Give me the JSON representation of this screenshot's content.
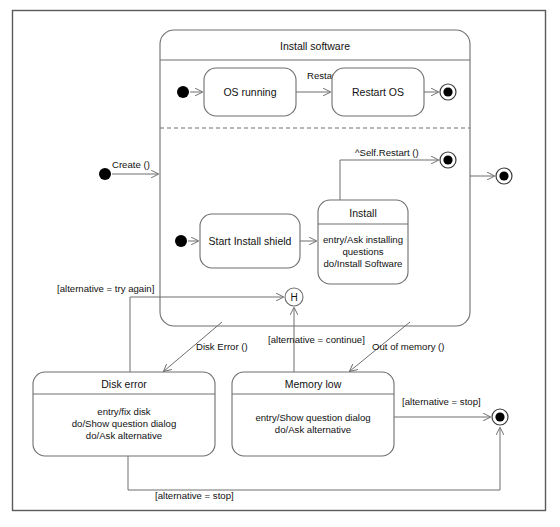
{
  "diagram": {
    "kind": "uml-state-machine-diagram",
    "composite": {
      "title": "Install software",
      "bounds": {
        "x": 160,
        "y": 30,
        "w": 310,
        "h": 296,
        "r": 14
      },
      "title_divider_y": 60,
      "region_divider_y": 128
    },
    "states": [
      {
        "id": "os-running",
        "name": "OS running",
        "x": 204,
        "y": 68,
        "w": 92,
        "h": 48,
        "r": 12,
        "body": []
      },
      {
        "id": "restart-os",
        "name": "Restart OS",
        "x": 332,
        "y": 68,
        "w": 92,
        "h": 48,
        "r": 12,
        "body": []
      },
      {
        "id": "start-install-shield",
        "name": "Start Install shield",
        "x": 200,
        "y": 214,
        "w": 100,
        "h": 54,
        "r": 12,
        "body": []
      },
      {
        "id": "install",
        "name": "Install",
        "x": 318,
        "y": 200,
        "w": 90,
        "h": 84,
        "r": 12,
        "title_divider_y": 224,
        "body": [
          "entry/Ask installing",
          "questions",
          "do/Install Software"
        ]
      },
      {
        "id": "disk-error",
        "name": "Disk error",
        "x": 33,
        "y": 372,
        "w": 182,
        "h": 84,
        "r": 12,
        "title_divider_y": 394,
        "body": [
          "entry/fix disk",
          "do/Show question dialog",
          "do/Ask alternative"
        ]
      },
      {
        "id": "memory-low",
        "name": "Memory low",
        "x": 232,
        "y": 372,
        "w": 162,
        "h": 84,
        "r": 12,
        "title_divider_y": 394,
        "body": [
          "entry/Show question dialog",
          "do/Ask alternative"
        ]
      }
    ],
    "pseudostates": [
      {
        "id": "initial-outer",
        "type": "initial",
        "cx": 105,
        "cy": 174,
        "r": 6
      },
      {
        "id": "initial-os-running",
        "type": "initial",
        "cx": 183,
        "cy": 92,
        "r": 6
      },
      {
        "id": "initial-install",
        "type": "initial",
        "cx": 181,
        "cy": 241,
        "r": 6
      },
      {
        "id": "final-restart-os",
        "type": "final",
        "cx": 448,
        "cy": 92,
        "r": 8
      },
      {
        "id": "final-install-region",
        "type": "final",
        "cx": 448,
        "cy": 160,
        "r": 8
      },
      {
        "id": "final-outer-right",
        "type": "final",
        "cx": 504,
        "cy": 176,
        "r": 8
      },
      {
        "id": "final-bottom-right",
        "type": "final",
        "cx": 500,
        "cy": 417,
        "r": 8
      },
      {
        "id": "history",
        "type": "history",
        "cx": 294,
        "cy": 297,
        "r": 9,
        "label": "H"
      }
    ],
    "transitions": [
      {
        "id": "t-create",
        "label": "Create ()",
        "label_x": 112,
        "label_y": 168
      },
      {
        "id": "t-restart",
        "label": "Restart ()",
        "label_x": 307,
        "label_y": 79
      },
      {
        "id": "t-self-restart",
        "label": "^Self.Restart ()",
        "label_x": 355,
        "label_y": 156
      },
      {
        "id": "t-try-again",
        "label": "[alternative = try again]",
        "label_x": 57,
        "label_y": 292
      },
      {
        "id": "t-disk-error",
        "label": "Disk Error ()",
        "label_x": 196,
        "label_y": 350
      },
      {
        "id": "t-continue",
        "label": "[alternative = continue]",
        "label_x": 268,
        "label_y": 343
      },
      {
        "id": "t-out-of-memory",
        "label": "Out of memory ()",
        "label_x": 372,
        "label_y": 350
      },
      {
        "id": "t-stop-right",
        "label": "[alternative = stop]",
        "label_x": 402,
        "label_y": 405
      },
      {
        "id": "t-stop-bottom",
        "label": "[alternative = stop]",
        "label_x": 155,
        "label_y": 499
      }
    ],
    "colors": {
      "stroke": "#6e6e6e",
      "border": "#5a5a5a",
      "text": "#111111",
      "fill": "#ffffff",
      "dot": "#000000"
    }
  }
}
